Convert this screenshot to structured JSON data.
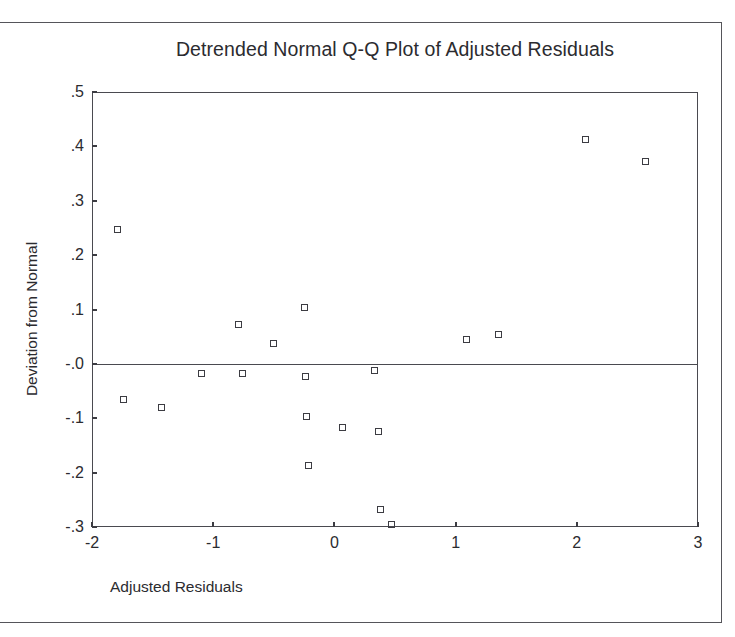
{
  "chart_data": {
    "type": "scatter",
    "title": "Detrended Normal Q-Q Plot of Adjusted Residuals",
    "xlabel": "Adjusted Residuals",
    "ylabel": "Deviation from Normal",
    "xlim": [
      -2,
      3
    ],
    "ylim": [
      -0.3,
      0.5
    ],
    "grid": false,
    "legend": null,
    "xticks": [
      "-2",
      "-1",
      "0",
      "1",
      "2",
      "3"
    ],
    "xtick_values": [
      -2,
      -1,
      0,
      1,
      2,
      3
    ],
    "yticks": [
      ".5",
      ".4",
      ".3",
      ".2",
      ".1",
      "-.0",
      "-.1",
      "-.2",
      "-.3"
    ],
    "ytick_values": [
      0.5,
      0.4,
      0.3,
      0.2,
      0.1,
      0.0,
      -0.1,
      -0.2,
      -0.3
    ],
    "reference_line_y": 0.0,
    "marker": "open-square",
    "points": [
      {
        "x": -1.79,
        "y": 0.247
      },
      {
        "x": -1.74,
        "y": -0.066
      },
      {
        "x": -1.43,
        "y": -0.081
      },
      {
        "x": -1.1,
        "y": -0.017
      },
      {
        "x": -0.79,
        "y": 0.072
      },
      {
        "x": -0.76,
        "y": -0.017
      },
      {
        "x": -0.5,
        "y": 0.038
      },
      {
        "x": -0.25,
        "y": 0.103
      },
      {
        "x": -0.24,
        "y": -0.024
      },
      {
        "x": -0.23,
        "y": -0.096
      },
      {
        "x": -0.21,
        "y": -0.187
      },
      {
        "x": 0.07,
        "y": -0.117
      },
      {
        "x": 0.33,
        "y": -0.012
      },
      {
        "x": 0.36,
        "y": -0.124
      },
      {
        "x": 0.38,
        "y": -0.267
      },
      {
        "x": 0.47,
        "y": -0.296
      },
      {
        "x": 1.09,
        "y": 0.045
      },
      {
        "x": 1.35,
        "y": 0.054
      },
      {
        "x": 2.07,
        "y": 0.412
      },
      {
        "x": 2.57,
        "y": 0.373
      }
    ]
  }
}
